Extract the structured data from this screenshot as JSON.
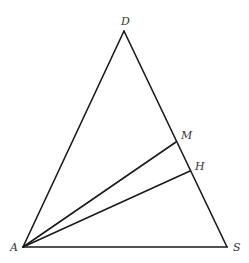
{
  "diagram": {
    "type": "geometry-triangle",
    "colors": {
      "stroke": "#1a1a1a",
      "label": "#333333",
      "background": "#ffffff"
    },
    "points": {
      "D": {
        "label": "D",
        "x": 124,
        "y": 31,
        "lx": 125,
        "ly": 25
      },
      "A": {
        "label": "A",
        "x": 23,
        "y": 247,
        "lx": 13,
        "ly": 251
      },
      "S": {
        "label": "S",
        "x": 227,
        "y": 247,
        "lx": 235,
        "ly": 251
      },
      "M": {
        "label": "M",
        "x": 176,
        "y": 142,
        "lx": 182,
        "ly": 139
      },
      "H": {
        "label": "H",
        "x": 190,
        "y": 171,
        "lx": 196,
        "ly": 170
      }
    },
    "segments": [
      {
        "from": "A",
        "to": "D"
      },
      {
        "from": "D",
        "to": "S"
      },
      {
        "from": "A",
        "to": "S"
      },
      {
        "from": "A",
        "to": "M"
      },
      {
        "from": "A",
        "to": "H"
      }
    ]
  }
}
